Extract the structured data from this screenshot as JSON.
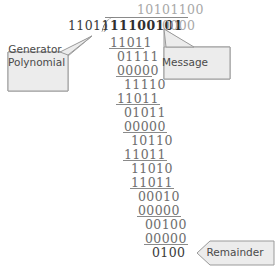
{
  "diagram": {
    "type": "long-division",
    "divisor": "11011",
    "quotient": "10101100",
    "dividend_message": "11100101",
    "dividend_zeros": "0000",
    "dividend_full": "111001010000",
    "remainder": "0100",
    "operator_symbol": ")"
  },
  "rows": [
    {
      "value": "11011",
      "ruled": true
    },
    {
      "value": "01111",
      "ruled": false
    },
    {
      "value": "00000",
      "ruled": true
    },
    {
      "value": "11110",
      "ruled": false
    },
    {
      "value": "11011",
      "ruled": true
    },
    {
      "value": "01011",
      "ruled": false
    },
    {
      "value": "00000",
      "ruled": true
    },
    {
      "value": "10110",
      "ruled": false
    },
    {
      "value": "11011",
      "ruled": true
    },
    {
      "value": "11010",
      "ruled": false
    },
    {
      "value": "11011",
      "ruled": true
    },
    {
      "value": "00010",
      "ruled": false
    },
    {
      "value": "00000",
      "ruled": true
    },
    {
      "value": "00100",
      "ruled": false
    },
    {
      "value": "00000",
      "ruled": true
    },
    {
      "value": "0100",
      "ruled": false
    }
  ],
  "callouts": {
    "generator": {
      "label": "Generator\nPolynomial",
      "points_to": "divisor"
    },
    "message": {
      "label": "Message",
      "points_to": "dividend"
    },
    "remainder": {
      "label": "Remainder",
      "points_to": "remainder"
    }
  },
  "colors": {
    "ink": "#6e6e6e",
    "ink_dark": "#3a3a3a",
    "ink_bold": "#2f2f2f",
    "ink_faint": "#a8a8a8",
    "rule": "#8a8a8a",
    "callout_fill": "#ececec",
    "callout_stroke": "#9a9a9a",
    "callout_text": "#4a4a4a",
    "background": "#ffffff"
  }
}
